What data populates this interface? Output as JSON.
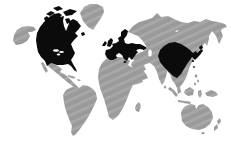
{
  "page": {
    "background": "#ffffff",
    "width_px": 231,
    "height_px": 149
  },
  "map": {
    "type": "world-map-silhouette",
    "description": "World map with North America, Europe and East Asia highlighted in black; all other landmasses gray with diagonal hatch texture; oceans white",
    "colors": {
      "ocean": "#ffffff",
      "base": "#9a9a9a",
      "base_stripe": "#a9a9a9",
      "highlight": "#0b0b0b"
    },
    "highlighted_region_names": [
      "North America (Canada & USA)",
      "Europe (incl. British Isles & Scandinavia)",
      "East Asia (China, Korea, Japan)"
    ],
    "regions": [
      {
        "id": "alaska",
        "name": "Alaska",
        "highlighted": false
      },
      {
        "id": "north-america",
        "name": "Canada & United States",
        "highlighted": true
      },
      {
        "id": "greenland",
        "name": "Greenland",
        "highlighted": false
      },
      {
        "id": "mexico-central-america",
        "name": "Mexico & Central America",
        "highlighted": false
      },
      {
        "id": "caribbean",
        "name": "Caribbean Islands",
        "highlighted": false
      },
      {
        "id": "south-america",
        "name": "South America",
        "highlighted": false
      },
      {
        "id": "africa",
        "name": "Africa",
        "highlighted": false
      },
      {
        "id": "madagascar",
        "name": "Madagascar",
        "highlighted": false
      },
      {
        "id": "europe",
        "name": "Europe",
        "highlighted": true
      },
      {
        "id": "british-isles",
        "name": "British Isles",
        "highlighted": true
      },
      {
        "id": "asia",
        "name": "Russia, Central & South Asia",
        "highlighted": false
      },
      {
        "id": "arabia",
        "name": "Arabian Peninsula / Middle East",
        "highlighted": false
      },
      {
        "id": "sakhalin",
        "name": "Sakhalin",
        "highlighted": false
      },
      {
        "id": "china-east-asia",
        "name": "China & Korea",
        "highlighted": true
      },
      {
        "id": "japan",
        "name": "Japan",
        "highlighted": true
      },
      {
        "id": "philippines",
        "name": "Philippines",
        "highlighted": false
      },
      {
        "id": "indonesia",
        "name": "Indonesia / Malay Archipelago",
        "highlighted": false
      },
      {
        "id": "new-guinea",
        "name": "New Guinea",
        "highlighted": false
      },
      {
        "id": "australia",
        "name": "Australia",
        "highlighted": false
      },
      {
        "id": "new-zealand",
        "name": "New Zealand",
        "highlighted": false
      }
    ]
  }
}
